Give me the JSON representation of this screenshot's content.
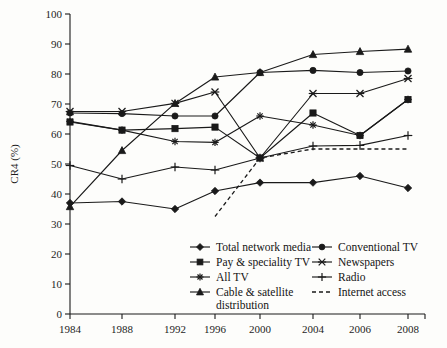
{
  "chart_data": {
    "type": "line",
    "title": "",
    "xlabel": "",
    "ylabel": "CR4 (%)",
    "x": [
      1984,
      1988,
      1992,
      1996,
      2000,
      2004,
      2006,
      2008
    ],
    "xticklabels": [
      "1984",
      "1988",
      "1992",
      "1996",
      "2000",
      "2004",
      "2006",
      "2008"
    ],
    "yticklabels": [
      "0",
      "10",
      "20",
      "30",
      "40",
      "50",
      "60",
      "70",
      "80",
      "90",
      "100"
    ],
    "yticks": [
      0,
      10,
      20,
      30,
      40,
      50,
      60,
      70,
      80,
      90,
      100
    ],
    "ylim": [
      0,
      100
    ],
    "grid": false,
    "legend_position": "inside-bottom-center",
    "series": [
      {
        "name": "Total network media",
        "marker": "diamond",
        "style": "solid",
        "values": [
          37.0,
          37.5,
          35.0,
          41.0,
          43.8,
          43.8,
          46.0,
          42.0
        ]
      },
      {
        "name": "Conventional TV",
        "marker": "circle",
        "style": "solid",
        "values": [
          67.0,
          66.8,
          66.0,
          66.0,
          80.5,
          81.2,
          80.5,
          81.0
        ]
      },
      {
        "name": "Pay & speciality TV",
        "marker": "square",
        "style": "solid",
        "values": [
          64.0,
          61.3,
          61.8,
          62.3,
          52.0,
          67.0,
          59.5,
          71.5
        ]
      },
      {
        "name": "Newspapers",
        "marker": "cross-x",
        "style": "solid",
        "values": [
          67.5,
          67.5,
          70.2,
          74.0,
          52.0,
          73.5,
          73.5,
          78.5
        ]
      },
      {
        "name": "All TV",
        "marker": "star",
        "style": "solid",
        "values": [
          64.2,
          61.3,
          57.5,
          57.2,
          66.0,
          63.0,
          59.5,
          71.5
        ]
      },
      {
        "name": "Radio",
        "marker": "plus",
        "style": "solid",
        "values": [
          49.5,
          45.0,
          49.0,
          48.0,
          52.0,
          56.0,
          56.2,
          59.5
        ]
      },
      {
        "name": "Cable & satellite distribution",
        "marker": "triangle",
        "style": "solid",
        "values": [
          35.8,
          54.5,
          70.2,
          79.0,
          80.5,
          86.5,
          87.5,
          88.3
        ]
      },
      {
        "name": "Internet access",
        "marker": "none",
        "style": "dashed",
        "values": [
          null,
          null,
          null,
          32.5,
          52.0,
          55.0,
          55.0,
          55.0
        ]
      }
    ],
    "legend": [
      {
        "label": "Total network media",
        "marker": "diamond",
        "style": "solid",
        "column": 1
      },
      {
        "label": "Conventional TV",
        "marker": "circle",
        "style": "solid",
        "column": 2
      },
      {
        "label": "Pay & speciality TV",
        "marker": "square",
        "style": "solid",
        "column": 1
      },
      {
        "label": "Newspapers",
        "marker": "cross-x",
        "style": "solid",
        "column": 2
      },
      {
        "label": "All TV",
        "marker": "star",
        "style": "solid",
        "column": 1
      },
      {
        "label": "Radio",
        "marker": "plus",
        "style": "solid",
        "column": 2
      },
      {
        "label": "Cable & satellite",
        "label2": "distribution",
        "marker": "triangle",
        "style": "solid",
        "column": 1
      },
      {
        "label": "Internet access",
        "marker": "none",
        "style": "dashed",
        "column": 2
      }
    ],
    "colors": {
      "ink": "#1a1a1a",
      "background": "#fdfdfb"
    }
  }
}
